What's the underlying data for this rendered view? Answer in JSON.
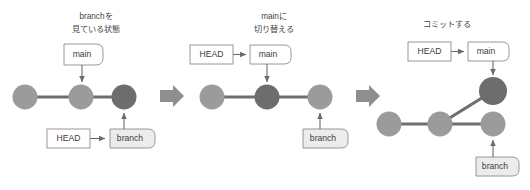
{
  "diagram": {
    "title_footer": "",
    "colors": {
      "commit_light": "#9b9b9b",
      "commit_dark": "#6d6d6d",
      "edge": "#6e6e6e",
      "pointer_arrow": "#6b6b6b",
      "box_stroke": "#8d8d8d",
      "box_fill_white": "#ffffff",
      "box_fill_gray": "#ececec",
      "step_arrow": "#8e8e8e",
      "text": "#3c3c3c"
    },
    "panels": [
      {
        "id": "panel-1",
        "caption_line1": "branchを",
        "caption_line2": "見ている状態",
        "labels": {
          "main": "main",
          "head": "HEAD",
          "branch": "branch"
        },
        "commits": [
          {
            "name": "commit-a",
            "state": "light"
          },
          {
            "name": "commit-b",
            "state": "light"
          },
          {
            "name": "commit-c",
            "state": "dark"
          }
        ]
      },
      {
        "id": "panel-2",
        "caption_line1": "mainに",
        "caption_line2": "切り替える",
        "labels": {
          "main": "main",
          "head": "HEAD",
          "branch": "branch"
        },
        "commits": [
          {
            "name": "commit-a",
            "state": "light"
          },
          {
            "name": "commit-b",
            "state": "dark"
          },
          {
            "name": "commit-c",
            "state": "light"
          }
        ]
      },
      {
        "id": "panel-3",
        "caption_line1": "コミットする",
        "caption_line2": "",
        "labels": {
          "main": "main",
          "head": "HEAD",
          "branch": "branch"
        },
        "commits": [
          {
            "name": "commit-a",
            "state": "light"
          },
          {
            "name": "commit-b",
            "state": "light"
          },
          {
            "name": "commit-c",
            "state": "light"
          },
          {
            "name": "commit-new",
            "state": "dark"
          }
        ]
      }
    ],
    "step_arrows": [
      "step-arrow-1",
      "step-arrow-2"
    ]
  }
}
